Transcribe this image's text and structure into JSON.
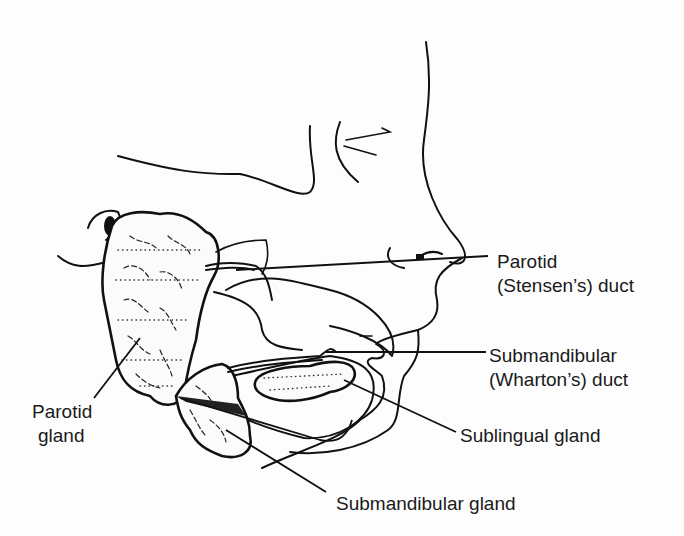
{
  "figure": {
    "labels": {
      "parotid_duct": {
        "line1": "Parotid",
        "line2": "(Stensen’s) duct"
      },
      "submandibular_duct": {
        "line1": "Submandibular",
        "line2": "(Wharton’s) duct"
      },
      "sublingual_gland": {
        "line1": "Sublingual gland"
      },
      "parotid_gland": {
        "line1": "Parotid",
        "line2": "gland"
      },
      "submandibular_gland": {
        "line1": "Submandibular gland"
      }
    }
  }
}
